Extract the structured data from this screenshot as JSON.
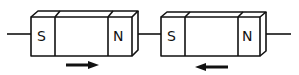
{
  "diagram": {
    "magnets": [
      {
        "south_label": "S",
        "north_label": "N",
        "arrow_direction": "right"
      },
      {
        "south_label": "S",
        "north_label": "N",
        "arrow_direction": "left"
      }
    ],
    "colors": {
      "stroke": "#111111",
      "background": "#ffffff"
    }
  }
}
